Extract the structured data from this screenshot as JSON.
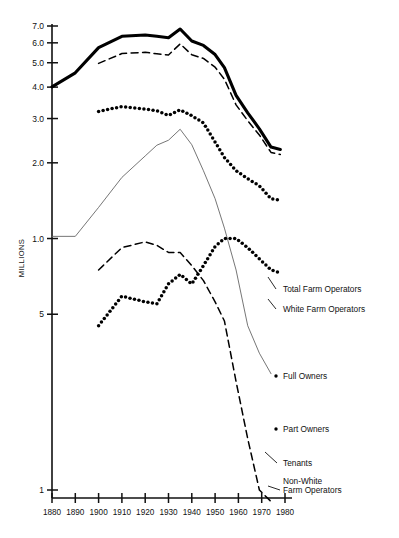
{
  "chart_data": {
    "type": "line",
    "title": "",
    "xlabel": "",
    "ylabel": "MILLIONS",
    "yscale": "log",
    "grid": false,
    "legend_position": "right-inline",
    "xlim": [
      1880,
      1980
    ],
    "ylim": [
      0.1,
      7.5
    ],
    "x_ticks": [
      1880,
      1890,
      1900,
      1910,
      1920,
      1930,
      1940,
      1950,
      1960,
      1970,
      1980
    ],
    "y_ticks": [
      "7.0",
      "6.0",
      "5.0",
      "4.0",
      "3.0",
      "2.0",
      "1.0",
      "5",
      "1"
    ],
    "y_tick_values": [
      7.0,
      6.0,
      5.0,
      4.0,
      3.0,
      2.0,
      1.0,
      0.5,
      0.1
    ],
    "series": [
      {
        "name": "Total Farm Operators",
        "style": "solid-bold",
        "color": "#000000",
        "x": [
          1880,
          1890,
          1900,
          1910,
          1920,
          1925,
          1930,
          1935,
          1940,
          1945,
          1950,
          1954,
          1959,
          1964,
          1969,
          1974,
          1978
        ],
        "values": [
          4.01,
          4.56,
          5.74,
          6.37,
          6.45,
          6.37,
          6.29,
          6.81,
          6.1,
          5.86,
          5.39,
          4.78,
          3.71,
          3.16,
          2.73,
          2.31,
          2.26
        ]
      },
      {
        "name": "White Farm Operators",
        "style": "dashed",
        "color": "#000000",
        "x": [
          1900,
          1910,
          1920,
          1925,
          1930,
          1935,
          1940,
          1945,
          1950,
          1954,
          1959,
          1964,
          1969,
          1974,
          1978
        ],
        "values": [
          4.97,
          5.44,
          5.5,
          5.43,
          5.37,
          5.94,
          5.38,
          5.2,
          4.8,
          4.3,
          3.4,
          2.94,
          2.58,
          2.2,
          2.16
        ]
      },
      {
        "name": "Full Owners",
        "style": "dotted-heavy",
        "color": "#000000",
        "x": [
          1900,
          1910,
          1920,
          1925,
          1930,
          1935,
          1940,
          1945,
          1950,
          1954,
          1959,
          1964,
          1969,
          1974,
          1978
        ],
        "values": [
          3.2,
          3.35,
          3.27,
          3.22,
          3.09,
          3.25,
          3.08,
          2.88,
          2.42,
          2.1,
          1.86,
          1.73,
          1.62,
          1.44,
          1.42
        ]
      },
      {
        "name": "Tenants",
        "style": "solid-thin",
        "color": "#666666",
        "x": [
          1880,
          1890,
          1900,
          1910,
          1920,
          1925,
          1930,
          1935,
          1940,
          1945,
          1950,
          1954,
          1959,
          1964,
          1969,
          1974
        ],
        "values": [
          1.02,
          1.02,
          1.33,
          1.75,
          2.13,
          2.35,
          2.46,
          2.72,
          2.36,
          1.86,
          1.44,
          1.1,
          0.75,
          0.45,
          0.35,
          0.29
        ]
      },
      {
        "name": "Part Owners",
        "style": "dotted-heavy",
        "color": "#000000",
        "x": [
          1900,
          1910,
          1920,
          1925,
          1930,
          1935,
          1940,
          1945,
          1950,
          1954,
          1959,
          1964,
          1969,
          1974,
          1978
        ],
        "values": [
          0.45,
          0.59,
          0.56,
          0.55,
          0.66,
          0.72,
          0.66,
          0.78,
          0.93,
          1.0,
          1.0,
          0.92,
          0.83,
          0.75,
          0.73
        ]
      },
      {
        "name": "Non-White Farm Operators",
        "style": "dashed",
        "color": "#000000",
        "x": [
          1900,
          1910,
          1920,
          1925,
          1930,
          1935,
          1940,
          1945,
          1950,
          1954,
          1959,
          1964,
          1969,
          1974
        ],
        "values": [
          0.75,
          0.92,
          0.97,
          0.94,
          0.88,
          0.88,
          0.78,
          0.68,
          0.56,
          0.47,
          0.27,
          0.16,
          0.1,
          0.09
        ]
      }
    ],
    "annotations": [
      {
        "text": "Total Farm Operators",
        "series": "Total Farm Operators"
      },
      {
        "text": "White Farm Operators",
        "series": "White Farm Operators"
      },
      {
        "text": "Full Owners",
        "series": "Full Owners"
      },
      {
        "text": "Part Owners",
        "series": "Part Owners"
      },
      {
        "text": "Tenants",
        "series": "Tenants"
      },
      {
        "text": "Non-White",
        "series": "Non-White Farm Operators"
      },
      {
        "text": "Farm Operators",
        "series": "Non-White Farm Operators"
      }
    ]
  },
  "axis": {
    "y_title": "MILLIONS",
    "y_labels": [
      "7.0",
      "6.0",
      "5.0",
      "4.0",
      "3.0",
      "2.0",
      "1.0",
      "5",
      "1"
    ],
    "x_labels": [
      "1880",
      "1890",
      "1900",
      "1910",
      "1920",
      "1930",
      "1940",
      "1950",
      "1960",
      "1970",
      "1980"
    ]
  },
  "labels": {
    "total_farm_operators": "Total  Farm  Operators",
    "white_farm_operators": "White  Farm  Operators",
    "full_owners": "Full  Owners",
    "part_owners": "Part  Owners",
    "tenants": "Tenants",
    "nonwhite_line1": "Non-White",
    "nonwhite_line2": "Farm  Operators"
  }
}
